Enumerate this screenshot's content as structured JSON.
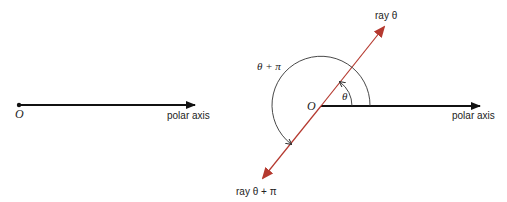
{
  "left_diagram": {
    "origin_label": "O",
    "axis_label": "polar axis"
  },
  "right_diagram": {
    "origin_label": "O",
    "axis_label": "polar axis",
    "ray_label": "ray θ",
    "opposite_ray_label": "ray θ + π",
    "small_angle_label": "θ",
    "large_angle_label": "θ + π"
  },
  "colors": {
    "axis": "#111111",
    "ray": "#b5392f",
    "arc": "#333333"
  }
}
